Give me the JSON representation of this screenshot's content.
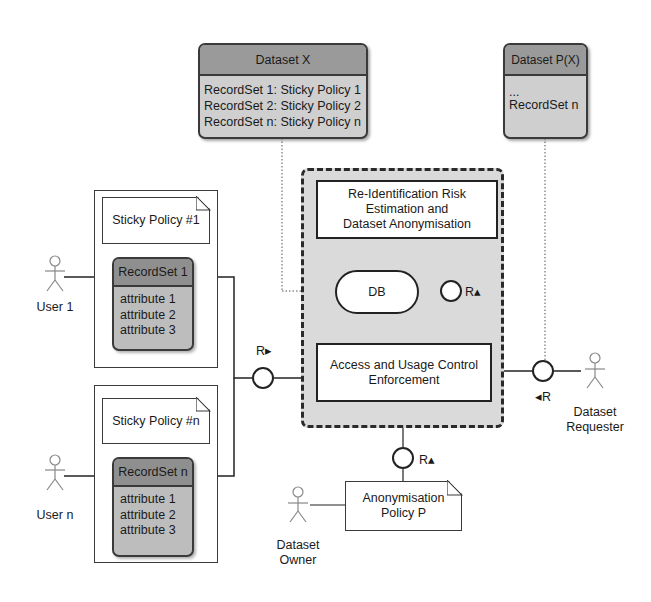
{
  "datasets": {
    "dataset_x": {
      "title": "Dataset X",
      "rows": [
        "RecordSet 1: Sticky Policy 1",
        "RecordSet 2: Sticky Policy 2",
        "RecordSet n: Sticky Policy n"
      ]
    },
    "dataset_px": {
      "title": "Dataset P(X)",
      "rows": [
        "...",
        "RecordSet n"
      ]
    }
  },
  "users": [
    {
      "label": "User 1",
      "sticky_policy": "Sticky Policy #1",
      "recordset": {
        "title": "RecordSet 1",
        "attributes": [
          "attribute 1",
          "attribute 2",
          "attribute 3"
        ]
      }
    },
    {
      "label": "User n",
      "sticky_policy": "Sticky Policy #n",
      "recordset": {
        "title": "RecordSet n",
        "attributes": [
          "attribute 1",
          "attribute 2",
          "attribute 3"
        ]
      }
    }
  ],
  "components": {
    "reid": "Re-Identification Risk Estimation and Dataset Anonymisation",
    "reid_lines": [
      "Re-Identification Risk",
      "Estimation and",
      "Dataset Anonymisation"
    ],
    "db": "DB",
    "access_lines": [
      "Access and Usage Control",
      "Enforcement"
    ]
  },
  "interfaces": {
    "r_left": "R▸",
    "r_inner": "R▴",
    "r_owner": "R▴",
    "r_requester": "◂R"
  },
  "actors": {
    "requester_lines": [
      "Dataset",
      "Requester"
    ],
    "owner_lines": [
      "Dataset",
      "Owner"
    ]
  },
  "policy": {
    "lines": [
      "Anonymisation",
      "Policy P"
    ]
  }
}
